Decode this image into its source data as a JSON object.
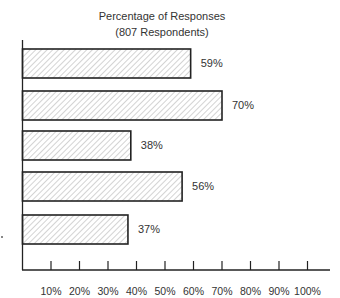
{
  "chart_data": {
    "type": "bar",
    "orientation": "horizontal",
    "title": "Percentage of Responses",
    "subtitle": "(807 Respondents)",
    "categories": [
      "",
      "",
      "",
      "",
      ""
    ],
    "values": [
      59,
      70,
      38,
      56,
      37
    ],
    "value_labels": [
      "59%",
      "70%",
      "38%",
      "56%",
      "37%"
    ],
    "xlabel": "",
    "ylabel": "",
    "xlim": [
      0,
      105
    ],
    "xticks": [
      "10%",
      "20%",
      "30%",
      "40%",
      "50%",
      "60%",
      "70%",
      "80%",
      "90%",
      "100%"
    ],
    "grid": false,
    "legend": null,
    "fill_pattern": "diagonal-hatch"
  },
  "colors": {
    "bar_outline": "#222222",
    "hatch": "#9a9a9a",
    "axis": "#222222"
  }
}
